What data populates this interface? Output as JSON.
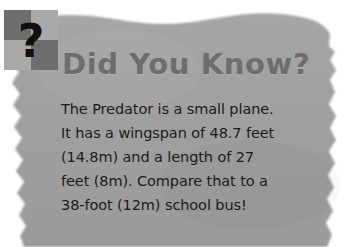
{
  "card": {
    "type": "did-you-know-fact-box",
    "background_color": "#a0a0a0",
    "page_color": "#ffffff",
    "edge_style": "torn-paper"
  },
  "badge": {
    "icon": "question-mark-puzzle-icon",
    "glyph": "?",
    "tiles": [
      {
        "position": "top-left",
        "color": "#6e6e6e"
      },
      {
        "position": "top-right",
        "color": "#a9a9a9"
      },
      {
        "position": "bottom-left",
        "color": "#a9a9a9"
      },
      {
        "position": "bottom-right",
        "color": "#6e6e6e"
      }
    ],
    "glyph_color": "#101010"
  },
  "headline": {
    "text": "Did You Know?",
    "color": "#6d6d6d"
  },
  "body": {
    "color": "#1b1b1b",
    "lines": [
      "The Predator is a small plane.",
      "It has a wingspan of 48.7 feet",
      "(14.8m) and a length of 27",
      "feet (8m). Compare that to a",
      "38-foot (12m) school bus!"
    ],
    "full_text": "The Predator is a small plane. It has a wingspan of 48.7 feet (14.8m) and a length of 27 feet (8m). Compare that to a 38-foot (12m) school bus!"
  }
}
